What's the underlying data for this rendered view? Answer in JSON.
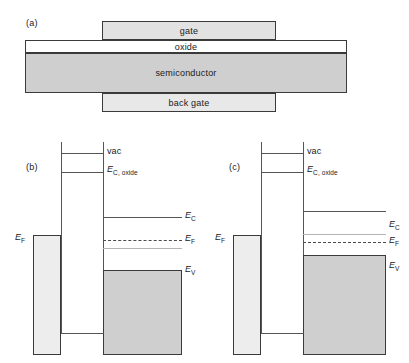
{
  "figure": {
    "type": "schematic-band-diagram",
    "panels": [
      "a",
      "b",
      "c"
    ]
  },
  "panel_a": {
    "tag": "(a)",
    "caption": "MOS capacitor cross-section with gate, oxide, semiconductor and back gate",
    "layers": [
      {
        "name": "gate",
        "label": "gate",
        "fill": "#e2e2e2"
      },
      {
        "name": "oxide",
        "label": "oxide",
        "fill": "#ffffff"
      },
      {
        "name": "semiconductor",
        "label": "semiconductor",
        "fill": "#cfcfcf"
      },
      {
        "name": "back-gate",
        "label": "back gate",
        "fill": "#e8e8e8"
      }
    ]
  },
  "panel_b": {
    "tag": "(b)",
    "caption": "Flat-band / equilibrium energy band diagram",
    "levels": {
      "vac": "vac",
      "ec_oxide_prefix": "E",
      "ec_oxide_sub": "C, oxide",
      "ec_prefix": "E",
      "ec_sub": "C",
      "ef_prefix": "E",
      "ef_sub": "F",
      "ev_prefix": "E",
      "ev_sub": "V",
      "ef_metal_prefix": "E",
      "ef_metal_sub": "F"
    }
  },
  "panel_c": {
    "tag": "(c)",
    "caption": "Biased energy band diagram with band bending",
    "levels": {
      "vac": "vac",
      "ec_oxide_prefix": "E",
      "ec_oxide_sub": "C, oxide",
      "ec_prefix": "E",
      "ec_sub": "C",
      "ef_prefix": "E",
      "ef_sub": "F",
      "ev_prefix": "E",
      "ev_sub": "V",
      "ef_metal_prefix": "E",
      "ef_metal_sub": "F"
    }
  },
  "colors": {
    "line": "#555555",
    "faint_line": "#b4b4b4",
    "border": "#3a3a3a",
    "metal_fill": "#ededed",
    "valence_fill": "#cfcfcf",
    "semiconductor_fill": "#cfcfcf"
  }
}
